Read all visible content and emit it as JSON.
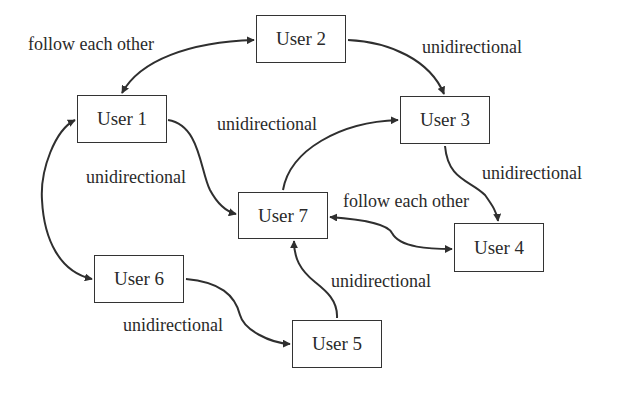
{
  "nodes": [
    {
      "id": "user1",
      "label": "User 1",
      "x": 77,
      "y": 95,
      "w": 90,
      "h": 48
    },
    {
      "id": "user2",
      "label": "User 2",
      "x": 256,
      "y": 15,
      "w": 90,
      "h": 48
    },
    {
      "id": "user3",
      "label": "User 3",
      "x": 400,
      "y": 96,
      "w": 90,
      "h": 48
    },
    {
      "id": "user4",
      "label": "User 4",
      "x": 454,
      "y": 223,
      "w": 90,
      "h": 49
    },
    {
      "id": "user5",
      "label": "User 5",
      "x": 292,
      "y": 320,
      "w": 90,
      "h": 48
    },
    {
      "id": "user6",
      "label": "User 6",
      "x": 94,
      "y": 255,
      "w": 90,
      "h": 48
    },
    {
      "id": "user7",
      "label": "User 7",
      "x": 238,
      "y": 192,
      "w": 90,
      "h": 47
    }
  ],
  "edges": [
    {
      "from": "user1",
      "to": "user2",
      "type": "follow each other"
    },
    {
      "from": "user2",
      "to": "user3",
      "type": "unidirectional"
    },
    {
      "from": "user1",
      "to": "user7",
      "type": "unidirectional"
    },
    {
      "from": "user7",
      "to": "user3",
      "type": "unidirectional"
    },
    {
      "from": "user3",
      "to": "user4",
      "type": "unidirectional"
    },
    {
      "from": "user7",
      "to": "user4",
      "type": "follow each other"
    },
    {
      "from": "user1",
      "to": "user6",
      "type": "follow each other"
    },
    {
      "from": "user6",
      "to": "user5",
      "type": "unidirectional"
    },
    {
      "from": "user5",
      "to": "user7",
      "type": "unidirectional"
    }
  ],
  "labels": {
    "u1_u2": "follow each other",
    "u2_u3": "unidirectional",
    "u7_u3": "unidirectional",
    "u1_u7": "unidirectional",
    "u3_u4": "unidirectional",
    "u7_u4": "follow each other",
    "u5_u7": "unidirectional",
    "u6_u5": "unidirectional"
  },
  "colors": {
    "stroke": "#2f2f2f",
    "text": "#2a2a2a",
    "background": "#ffffff"
  }
}
